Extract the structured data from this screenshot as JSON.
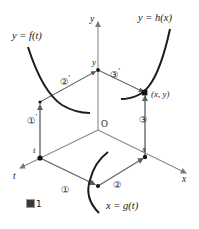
{
  "figure": {
    "caption_glyph": "figure-square-glyph",
    "caption_number": "1",
    "caption_text": "1"
  },
  "axes": {
    "y_axis_label": "y",
    "x_axis_label": "x",
    "t_axis_label": "t",
    "origin_label": "O"
  },
  "curves": [
    {
      "name": "f-curve",
      "label": "y = f(t)",
      "kind": "decreasing"
    },
    {
      "name": "h-curve",
      "label": "y = h(x)",
      "kind": "increasing"
    },
    {
      "name": "g-curve",
      "label": "x = g(t)",
      "kind": "planar"
    }
  ],
  "labels": {
    "f_of_t": "y = f(t)",
    "h_of_x": "y = h(x)",
    "g_of_t": "x = g(t)",
    "point_xy": "(x, y)",
    "vertex_y": "y",
    "vertex_x": "x",
    "vertex_t": "t"
  },
  "steps": [
    {
      "name": "step-1",
      "text": "①",
      "prime": ""
    },
    {
      "name": "step-2",
      "text": "②",
      "prime": ""
    },
    {
      "name": "step-3",
      "text": "③",
      "prime": ""
    },
    {
      "name": "step-1-prime",
      "text": "①",
      "prime": "′"
    },
    {
      "name": "step-2-prime",
      "text": "②",
      "prime": "′"
    },
    {
      "name": "step-3-prime",
      "text": "③",
      "prime": "′"
    }
  ],
  "colors": {
    "axis": "#8a8a8a",
    "curve": "#1c1c1c",
    "arrow": "#6e6e6e",
    "text": "#1a1a1a",
    "point": "#141414"
  }
}
